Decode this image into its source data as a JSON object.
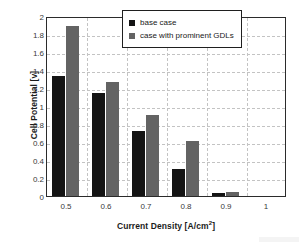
{
  "chart_data": {
    "type": "bar",
    "title": "",
    "xlabel": "Current Density [A/cm²]",
    "xlabel_base": "Current Density [A/cm",
    "xlabel_sup": "2",
    "xlabel_tail": "]",
    "ylabel": "Cell Potential [v]",
    "categories": [
      "0.5",
      "0.6",
      "0.7",
      "0.8",
      "0.9",
      "1"
    ],
    "series": [
      {
        "name": "base case",
        "color": "#141414",
        "values": [
          1.33,
          1.15,
          0.72,
          0.3,
          0.03,
          0
        ]
      },
      {
        "name": "case with prominent GDLs",
        "color": "#636363",
        "values": [
          1.89,
          1.27,
          0.9,
          0.61,
          0.05,
          0
        ]
      }
    ],
    "ylim": [
      0,
      2
    ],
    "ytick_labels": [
      "2",
      "1.8",
      "1.6",
      "1.4",
      "1.2",
      "1",
      "0.8",
      "0.6",
      "0.4",
      "0.2",
      "0"
    ],
    "ytick_values": [
      2,
      1.8,
      1.6,
      1.4,
      1.2,
      1,
      0.8,
      0.6,
      0.4,
      0.2,
      0
    ],
    "ytick_step": 0.2,
    "grid": true,
    "grid_style": "dashed",
    "grid_color": "#c3c3c3",
    "legend_position": "top-right",
    "frame_color": "#2b2b2b",
    "background": "#ffffff"
  }
}
